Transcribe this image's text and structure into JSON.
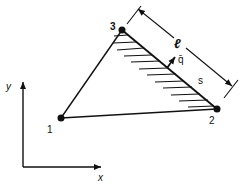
{
  "diagram": {
    "type": "triangular element with distributed edge load",
    "nodes": [
      {
        "id": "1",
        "label": "1",
        "x": 61,
        "y": 118
      },
      {
        "id": "2",
        "label": "2",
        "x": 217,
        "y": 109
      },
      {
        "id": "3",
        "label": "3",
        "x": 122,
        "y": 30
      }
    ],
    "edges": [
      {
        "from": "1",
        "to": "2"
      },
      {
        "from": "2",
        "to": "3"
      },
      {
        "from": "3",
        "to": "1"
      }
    ],
    "loaded_edge": {
      "from": "3",
      "to": "2",
      "hatched": true
    },
    "labels": {
      "length": "ℓ",
      "load": "q̄",
      "coordinate": "s",
      "x_axis": "x",
      "y_axis": "y"
    },
    "colors": {
      "stroke": "#111111",
      "background": "#ffffff"
    }
  }
}
